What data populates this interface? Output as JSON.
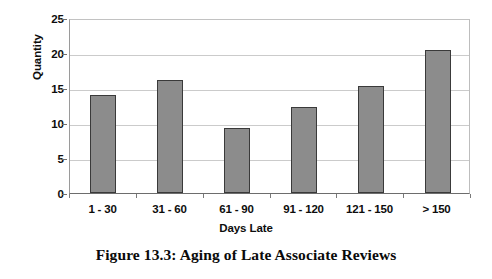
{
  "chart_data": {
    "type": "bar",
    "title": "",
    "categories": [
      "1 - 30",
      "31 - 60",
      "61 - 90",
      "91 - 120",
      "121 - 150",
      "> 150"
    ],
    "values": [
      14.0,
      16.1,
      9.3,
      12.3,
      15.3,
      20.4
    ],
    "xlabel": "Days Late",
    "ylabel": "Quantity",
    "ylim": [
      0,
      25
    ],
    "yticks": [
      0,
      5,
      10,
      15,
      20,
      25
    ],
    "ytick_labels": [
      "0",
      "5",
      "10",
      "15",
      "20",
      "25"
    ],
    "grid": "horizontal",
    "legend": "none",
    "bar_color": "#8c8c8c",
    "bar_outline_color": "#3a3a3a",
    "gridline_color": "#cbcbcb",
    "plot_background": "#ffffff"
  },
  "caption": {
    "text": "Figure 13.3:  Aging of Late Associate Reviews"
  }
}
